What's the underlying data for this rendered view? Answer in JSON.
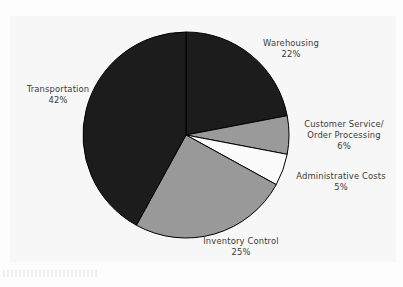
{
  "chart_data": {
    "type": "pie",
    "title": "",
    "subtitle": "",
    "xlabel": "",
    "ylabel": "",
    "legend_position": "none",
    "grid": false,
    "label_format": "name + percent",
    "start_angle_deg": 0,
    "direction": "clockwise",
    "categories": [
      "Warehousing",
      "Customer Service/ Order Processing",
      "Administrative Costs",
      "Inventory Control",
      "Transportation"
    ],
    "values": [
      22,
      6,
      5,
      25,
      42
    ],
    "slices": [
      {
        "id": "warehousing",
        "name_line1": "Warehousing",
        "name_line2": "",
        "percent_label": "22%",
        "value": 22,
        "color": "#1c1c1c",
        "edge_color": "#000000"
      },
      {
        "id": "customer-service",
        "name_line1": "Customer Service/",
        "name_line2": "Order Processing",
        "percent_label": "6%",
        "value": 6,
        "color": "#9a9a9a",
        "edge_color": "#000000"
      },
      {
        "id": "administrative-costs",
        "name_line1": "Administrative Costs",
        "name_line2": "",
        "percent_label": "5%",
        "value": 5,
        "color": "#fbfbfb",
        "edge_color": "#000000"
      },
      {
        "id": "inventory-control",
        "name_line1": "Inventory Control",
        "name_line2": "",
        "percent_label": "25%",
        "value": 25,
        "color": "#999999",
        "edge_color": "#000000"
      },
      {
        "id": "transportation",
        "name_line1": "Transportation",
        "name_line2": "",
        "percent_label": "42%",
        "value": 42,
        "color": "#1c1c1c",
        "edge_color": "#000000"
      }
    ]
  },
  "colors": {
    "page_background": "#fdfdfd",
    "plot_background": "#f7f7f7",
    "text": "#3a3a3a",
    "dark_slice": "#1c1c1c",
    "gray_slice": "#999999",
    "white_slice": "#fbfbfb",
    "slice_outline": "#000000"
  },
  "geometry": {
    "center_x": 186,
    "center_y": 135,
    "radius": 103
  }
}
